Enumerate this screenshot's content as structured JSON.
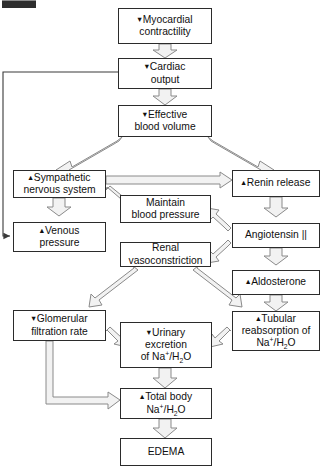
{
  "diagram": {
    "colors": {
      "box_border": "#2b2b2b",
      "box_fill": "#ffffff",
      "block_arrow_fill": "#f2f2f2",
      "block_arrow_stroke": "#8a8a8a",
      "thin_line": "#3a3a3a",
      "text": "#101010",
      "background": "#ffffff"
    },
    "glyphs": {
      "decrease": "↓",
      "increase": "↑",
      "decrease_small": "▾",
      "increase_small": "▴"
    },
    "nodes": [
      {
        "id": "myocardial-contractility",
        "name": "myocardial-contractility",
        "direction": "decrease",
        "line1": "Myocardial",
        "line2": "contractility",
        "text": "↓ Myocardial contractility"
      },
      {
        "id": "cardiac-output",
        "name": "cardiac-output",
        "direction": "decrease",
        "line1": "Cardiac",
        "line2": "output",
        "text": "↓ Cardiac output"
      },
      {
        "id": "effective-blood-volume",
        "name": "effective-blood-volume",
        "direction": "decrease",
        "line1": "Effective",
        "line2": "blood volume",
        "text": "↓ Effective blood volume"
      },
      {
        "id": "sympathetic-nervous-system",
        "name": "sympathetic-nervous-system",
        "direction": "increase",
        "line1": "Sympathetic",
        "line2": "nervous system",
        "text": "↑ Sympathetic nervous system"
      },
      {
        "id": "renin-release",
        "name": "renin-release",
        "direction": "increase",
        "line1": "Renin release",
        "line2": "",
        "text": "↑ Renin release"
      },
      {
        "id": "maintain-blood-pressure",
        "name": "maintain-blood-pressure",
        "direction": "none",
        "line1": "Maintain",
        "line2": "blood pressure",
        "text": "Maintain blood pressure"
      },
      {
        "id": "venous-pressure",
        "name": "venous-pressure",
        "direction": "increase",
        "line1": "Venous",
        "line2": "pressure",
        "text": "↑ Venous pressure"
      },
      {
        "id": "angiotensin-ii",
        "name": "angiotensin-ii",
        "direction": "none",
        "line1": "Angiotensin ||",
        "line2": "",
        "text": "Angiotensin ||"
      },
      {
        "id": "renal-vasoconstriction",
        "name": "renal-vasoconstriction",
        "direction": "none",
        "line1": "Renal",
        "line2": "vasoconstriction",
        "text": "Renal vasoconstriction"
      },
      {
        "id": "aldosterone",
        "name": "aldosterone",
        "direction": "increase",
        "line1": "Aldosterone",
        "line2": "",
        "text": "↑ Aldosterone"
      },
      {
        "id": "glomerular-filtration-rate",
        "name": "glomerular-filtration-rate",
        "direction": "decrease",
        "line1": "Glomerular",
        "line2": "filtration rate",
        "text": "↓ Glomerular filtration rate"
      },
      {
        "id": "urinary-excretion",
        "name": "urinary-excretion",
        "direction": "decrease",
        "line1": "Urinary",
        "line2": "excretion",
        "line3": "of Na+/H2O",
        "text": "↓ Urinary excretion of Na+/H2O"
      },
      {
        "id": "tubular-reabsorption",
        "name": "tubular-reabsorption",
        "direction": "increase",
        "line1": "Tubular",
        "line2": "reabsorption of",
        "line3": "Na+/H2O",
        "text": "↑ Tubular reabsorption of Na+/H2O"
      },
      {
        "id": "total-body-na-h2o",
        "name": "total-body-sodium-water",
        "direction": "increase",
        "line1": "Total body",
        "line2": "Na+/H2O",
        "text": "↑ Total body Na+/H2O"
      },
      {
        "id": "edema",
        "name": "edema",
        "direction": "none",
        "line1": "EDEMA",
        "line2": "",
        "text": "EDEMA"
      }
    ],
    "edges": [
      {
        "from": "myocardial-contractility",
        "to": "cardiac-output",
        "style": "block",
        "direction": "down"
      },
      {
        "from": "cardiac-output",
        "to": "effective-blood-volume",
        "style": "block",
        "direction": "down"
      },
      {
        "from": "effective-blood-volume",
        "to": "sympathetic-nervous-system",
        "style": "block",
        "direction": "diagonal-left"
      },
      {
        "from": "effective-blood-volume",
        "to": "renin-release",
        "style": "block",
        "direction": "diagonal-right"
      },
      {
        "from": "sympathetic-nervous-system",
        "to": "renin-release",
        "style": "block",
        "direction": "right"
      },
      {
        "from": "sympathetic-nervous-system",
        "to": "maintain-blood-pressure",
        "style": "block",
        "direction": "diagonal-right"
      },
      {
        "from": "sympathetic-nervous-system",
        "to": "venous-pressure",
        "style": "block",
        "direction": "down"
      },
      {
        "from": "venous-pressure",
        "to": "cardiac-output",
        "style": "thin",
        "direction": "feedback-left"
      },
      {
        "from": "renin-release",
        "to": "angiotensin-ii",
        "style": "block",
        "direction": "down"
      },
      {
        "from": "angiotensin-ii",
        "to": "maintain-blood-pressure",
        "style": "block",
        "direction": "diagonal-left-up"
      },
      {
        "from": "angiotensin-ii",
        "to": "renal-vasoconstriction",
        "style": "block",
        "direction": "diagonal-left-down"
      },
      {
        "from": "angiotensin-ii",
        "to": "aldosterone",
        "style": "block",
        "direction": "down"
      },
      {
        "from": "renal-vasoconstriction",
        "to": "glomerular-filtration-rate",
        "style": "block",
        "direction": "diagonal-left-down"
      },
      {
        "from": "renal-vasoconstriction",
        "to": "tubular-reabsorption",
        "style": "block",
        "direction": "diagonal-right-down"
      },
      {
        "from": "aldosterone",
        "to": "tubular-reabsorption",
        "style": "block",
        "direction": "down"
      },
      {
        "from": "glomerular-filtration-rate",
        "to": "urinary-excretion",
        "style": "block",
        "direction": "diagonal-right-down"
      },
      {
        "from": "tubular-reabsorption",
        "to": "urinary-excretion",
        "style": "block",
        "direction": "diagonal-left-down"
      },
      {
        "from": "glomerular-filtration-rate",
        "to": "total-body-na-h2o",
        "style": "block",
        "direction": "elbow-right"
      },
      {
        "from": "urinary-excretion",
        "to": "total-body-na-h2o",
        "style": "block",
        "direction": "down"
      },
      {
        "from": "total-body-na-h2o",
        "to": "edema",
        "style": "block",
        "direction": "down"
      }
    ]
  }
}
